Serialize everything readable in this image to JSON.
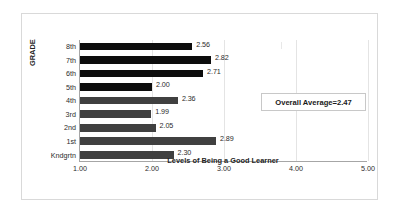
{
  "chart_data": {
    "type": "bar",
    "orientation": "horizontal",
    "title": "",
    "xlabel": "Levels of Being a Good Learner",
    "ylabel": "GRADE",
    "xlim": [
      1.0,
      5.0
    ],
    "xticks": [
      "1.00",
      "2.00",
      "3.00",
      "4.00",
      "5.00"
    ],
    "xtick_values": [
      1.0,
      2.0,
      3.0,
      4.0,
      5.0
    ],
    "grid": true,
    "grid_axis": "x",
    "legend": false,
    "categories": [
      "Kndgrtn",
      "1st",
      "2nd",
      "3rd",
      "4th",
      "5th",
      "6th",
      "7th",
      "8th"
    ],
    "values": [
      2.3,
      2.89,
      2.05,
      1.99,
      2.36,
      2.0,
      2.71,
      2.82,
      2.56
    ],
    "data_labels": [
      "2.30",
      "2.89",
      "2.05",
      "1.99",
      "2.36",
      "2.00",
      "2.71",
      "2.82",
      "2.56"
    ],
    "bar_colors": [
      "#404040",
      "#404040",
      "#404040",
      "#404040",
      "#404040",
      "#0d0d0d",
      "#0d0d0d",
      "#0d0d0d",
      "#0d0d0d"
    ],
    "annotations": [
      {
        "name": "overall-average",
        "text": "Overall Average=2.47",
        "value": 2.47
      }
    ],
    "colors": {
      "bar_dark": "#0d0d0d",
      "bar_gray": "#404040",
      "gridline": "#e4e4e4",
      "axis": "#a6a6a6",
      "frame": "#d9d9d9",
      "text": "#2b2b2b",
      "plot_background": "#ffffff"
    }
  },
  "overall_average": {
    "label": "Overall Average=2.47"
  }
}
